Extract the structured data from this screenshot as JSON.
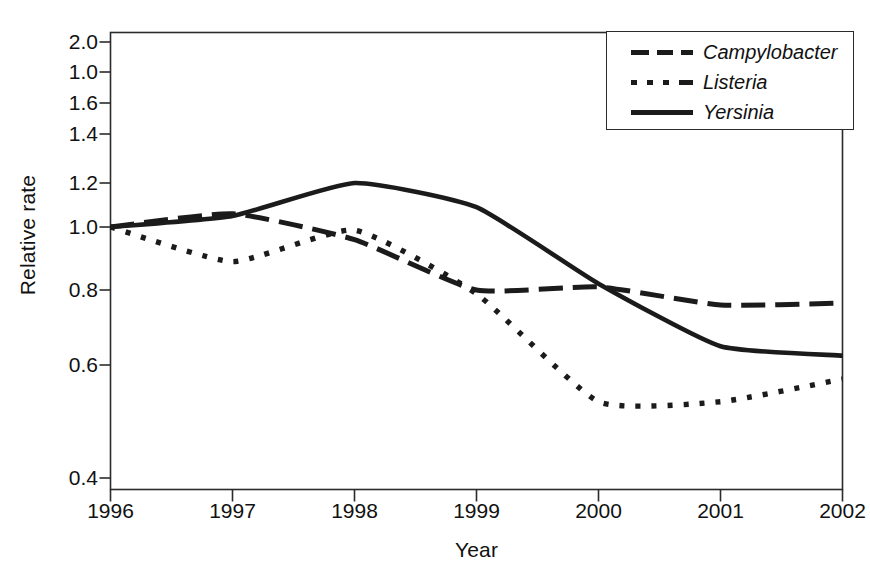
{
  "chart_data": {
    "type": "line",
    "title": "",
    "xlabel": "Year",
    "ylabel": "Relative rate",
    "grid": false,
    "legend_position": "top-right",
    "x": [
      1996,
      1997,
      1998,
      1999,
      2000,
      2001,
      2002
    ],
    "xtick_labels": [
      "1996",
      "1997",
      "1998",
      "1999",
      "2000",
      "2001",
      "2002"
    ],
    "ytick_labels": [
      "2.0",
      "1.0",
      "1.6",
      "1.4",
      "1.2",
      "1.0",
      "0.8",
      "0.6",
      "0.4"
    ],
    "ytick_values": [
      2.0,
      1.8,
      1.6,
      1.4,
      1.2,
      1.0,
      0.8,
      0.6,
      0.4
    ],
    "xlim": [
      1996,
      2002
    ],
    "ylim": [
      0.4,
      2.0
    ],
    "series": [
      {
        "name": "Campylobacter",
        "style": "dashed",
        "color": "#1b1b1b",
        "values": [
          1.0,
          1.06,
          0.96,
          0.8,
          0.81,
          0.76,
          0.765
        ]
      },
      {
        "name": "Listeria",
        "style": "dotted",
        "color": "#1b1b1b",
        "values": [
          1.0,
          0.89,
          0.99,
          0.79,
          0.535,
          0.535,
          0.575
        ]
      },
      {
        "name": "Yersinia",
        "style": "solid",
        "color": "#1b1b1b",
        "values": [
          1.0,
          1.05,
          1.2,
          1.09,
          0.82,
          0.65,
          0.625
        ]
      }
    ]
  },
  "axes": {
    "y_title": "Relative rate",
    "x_title": "Year"
  },
  "legend": {
    "entries": [
      {
        "label": "Campylobacter",
        "style": "dashed"
      },
      {
        "label": "Listeria",
        "style": "dotted"
      },
      {
        "label": "Yersinia",
        "style": "solid"
      }
    ]
  }
}
